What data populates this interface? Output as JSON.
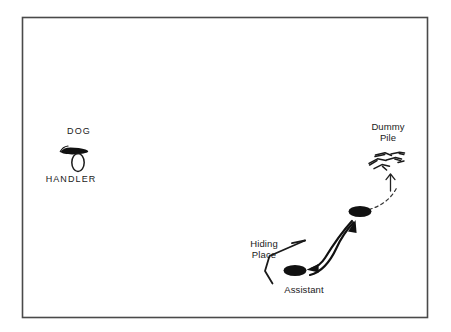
{
  "diagram": {
    "background_color": "#ffffff",
    "ink_color": "#1a1a1a",
    "border": {
      "color": "#4a4a4a",
      "x": 22,
      "y": 17,
      "width": 405,
      "height": 300
    },
    "labels": {
      "dog": "DOG",
      "handler": "HANDLER",
      "dummy_pile_line1": "Dummy",
      "dummy_pile_line2": "Pile",
      "hiding_place_line1": "Hiding",
      "hiding_place_line2": "Place",
      "assistant": "Assistant"
    },
    "markers": {
      "dog_symbol": "filled-dog-silhouette",
      "handler_symbol": "open-ellipse",
      "dummy_pile_symbol": "scattered-dummies",
      "waypoint_symbol": "filled-ellipse",
      "assistant_symbol": "filled-ellipse"
    },
    "paths": {
      "solid_arrow_up_right": "assistant-to-waypoint",
      "solid_arrow_down_left": "waypoint-to-assistant",
      "dashed_curve": "waypoint-to-dummy-pile",
      "dashed_arrow_head": "up-arrow",
      "hiding_place_line": "bent-screen-line"
    }
  }
}
